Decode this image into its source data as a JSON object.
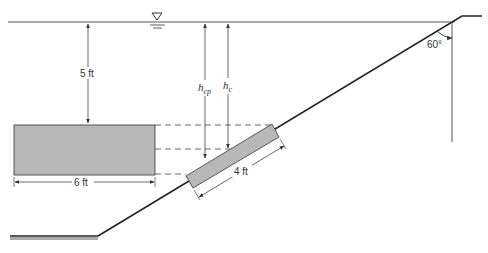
{
  "diagram": {
    "labels": {
      "depth": "5 ft",
      "width": "6 ft",
      "plate_length": "4 ft",
      "angle": "60°",
      "h_cp_main": "h",
      "h_cp_sub": "cp",
      "h_c_main": "h",
      "h_c_sub": "c"
    },
    "symbols": {
      "free_surface": "water-surface-triangle"
    },
    "colors": {
      "line": "#222222",
      "fill": "#b8b8b8",
      "ground": "#9a9a9a"
    }
  }
}
